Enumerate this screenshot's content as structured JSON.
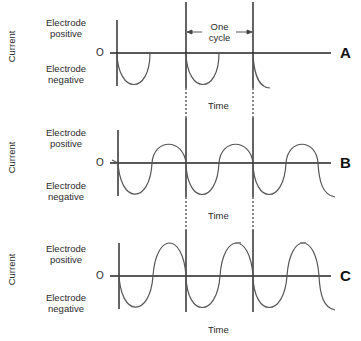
{
  "figure": {
    "panels": [
      {
        "id": "A",
        "letter": "A",
        "y_axis_label": "Current",
        "positive_label": "Electrode positive",
        "positive_line1": "Electrode",
        "positive_line2": "positive",
        "negative_line1": "Electrode",
        "negative_line2": "negative",
        "zero_label": "O",
        "x_axis_label": "Time",
        "waveform": "half-wave rectified (electrode negative half-cycles only)"
      },
      {
        "id": "B",
        "letter": "B",
        "y_axis_label": "Current",
        "positive_line1": "Electrode",
        "positive_line2": "positive",
        "negative_line1": "Electrode",
        "negative_line2": "negative",
        "zero_label": "O",
        "x_axis_label": "Time",
        "waveform": "full AC sine wave"
      },
      {
        "id": "C",
        "letter": "C",
        "y_axis_label": "Current",
        "positive_line1": "Electrode",
        "positive_line2": "positive",
        "negative_line1": "Electrode",
        "negative_line2": "negative",
        "zero_label": "O",
        "x_axis_label": "Time",
        "waveform": "full AC sine wave, larger amplitude positive peaks"
      }
    ],
    "cycle_annotation": {
      "line1": "One",
      "line2": "cycle"
    },
    "colors": {
      "line": "#222222",
      "curve": "#555555",
      "dashed": "#555555",
      "background": "#ffffff"
    }
  }
}
